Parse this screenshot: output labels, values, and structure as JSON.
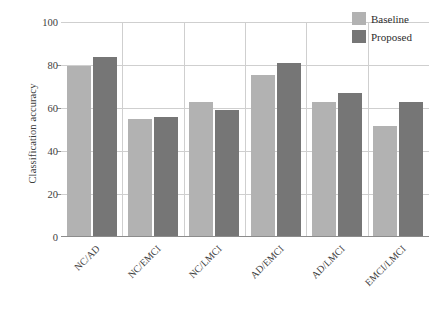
{
  "chart_data": {
    "type": "bar",
    "title": "",
    "xlabel": "",
    "ylabel": "Classification accuracy",
    "ylim": [
      0,
      100
    ],
    "yticks": [
      0,
      20,
      40,
      60,
      80,
      100
    ],
    "grid": "horizontal-and-vertical",
    "legend_position": "top-right",
    "categories": [
      "NC/AD",
      "NC/EMCI",
      "NC/LMCI",
      "AD/EMCI",
      "AD/LMCI",
      "EMCI/LMCI"
    ],
    "series": [
      {
        "name": "Baseline",
        "color": "#b2b2b2",
        "values": [
          79.5,
          55,
          63,
          75.5,
          63,
          51.5
        ]
      },
      {
        "name": "Proposed",
        "color": "#767676",
        "values": [
          83.5,
          56,
          59,
          81,
          67,
          63
        ]
      }
    ]
  },
  "legend": {
    "items": [
      {
        "label": "Baseline",
        "color": "#b2b2b2"
      },
      {
        "label": "Proposed",
        "color": "#767676"
      }
    ]
  }
}
